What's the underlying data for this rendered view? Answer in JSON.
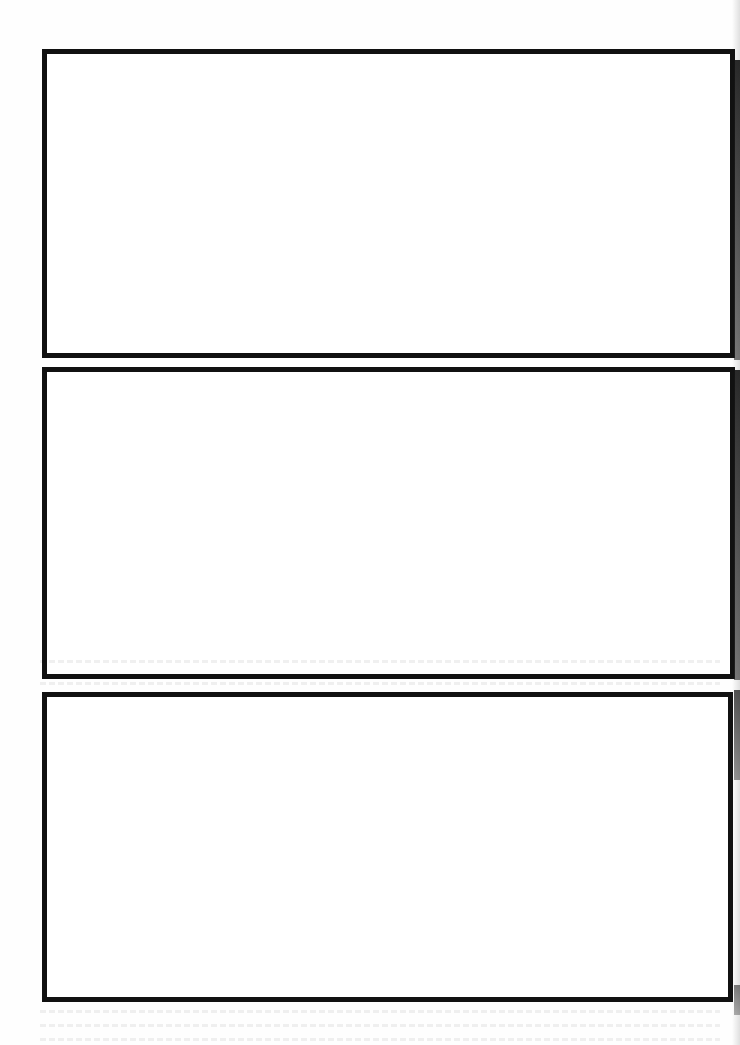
{
  "page": {
    "type": "blank-panel-template",
    "background_color": "#ffffff",
    "border_color": "#111111",
    "panels": [
      {
        "id": 1,
        "label": "",
        "content": "",
        "x": 42,
        "y": 49,
        "width": 693,
        "height": 309
      },
      {
        "id": 2,
        "label": "",
        "content": "",
        "x": 42,
        "y": 367,
        "width": 693,
        "height": 312
      },
      {
        "id": 3,
        "label": "",
        "content": "",
        "x": 42,
        "y": 692,
        "width": 691,
        "height": 310
      }
    ]
  }
}
